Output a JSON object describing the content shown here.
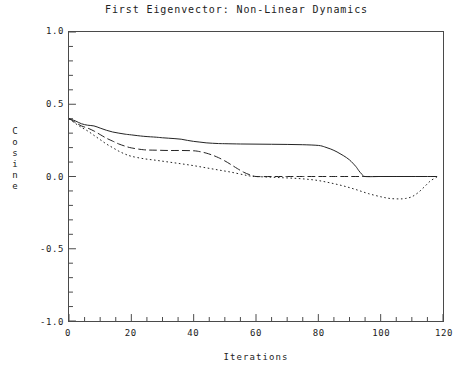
{
  "chart_data": {
    "type": "line",
    "title": "First Eigenvector: Non-Linear Dynamics",
    "xlabel": "Iterations",
    "ylabel": "Cosine",
    "xlim": [
      0,
      120
    ],
    "ylim": [
      -1.0,
      1.0
    ],
    "grid": false,
    "legend": "none",
    "x_ticks": [
      0,
      20,
      40,
      60,
      80,
      100,
      120
    ],
    "x_tick_labels": [
      "0",
      "20",
      "40",
      "60",
      "80",
      "100",
      "120"
    ],
    "x_minor_tick_step": 5,
    "y_ticks": [
      -1.0,
      -0.5,
      0.0,
      0.5,
      1.0
    ],
    "y_tick_labels": [
      "-1.0",
      "-0.5",
      "0.0",
      "0.5",
      "1.0"
    ],
    "y_minor_tick_step": 0.1,
    "series": [
      {
        "name": "solid-curve",
        "style": "solid",
        "color": "#222222",
        "x": [
          0,
          2,
          4,
          6,
          8,
          10,
          12,
          14,
          16,
          18,
          20,
          24,
          28,
          30,
          32,
          34,
          36,
          38,
          40,
          42,
          44,
          46,
          48,
          50,
          55,
          60,
          65,
          70,
          75,
          80,
          82,
          84,
          86,
          88,
          90,
          92,
          93,
          94,
          95,
          100,
          105,
          110,
          115,
          118
        ],
        "y": [
          0.4,
          0.385,
          0.365,
          0.355,
          0.35,
          0.335,
          0.32,
          0.308,
          0.3,
          0.293,
          0.288,
          0.278,
          0.272,
          0.268,
          0.265,
          0.262,
          0.258,
          0.25,
          0.243,
          0.238,
          0.233,
          0.23,
          0.228,
          0.227,
          0.225,
          0.224,
          0.223,
          0.222,
          0.22,
          0.215,
          0.205,
          0.19,
          0.17,
          0.145,
          0.115,
          0.07,
          0.04,
          0.015,
          0.0,
          0.0,
          0.0,
          0.0,
          0.0,
          0.0
        ]
      },
      {
        "name": "dashed-curve",
        "style": "dashed",
        "color": "#222222",
        "x": [
          0,
          2,
          4,
          6,
          8,
          10,
          12,
          14,
          16,
          18,
          20,
          24,
          28,
          32,
          36,
          40,
          42,
          44,
          46,
          48,
          50,
          52,
          54,
          56,
          58,
          60,
          65,
          70,
          75,
          80,
          85,
          90,
          95,
          100,
          105,
          110,
          115,
          118
        ],
        "y": [
          0.4,
          0.375,
          0.35,
          0.335,
          0.315,
          0.29,
          0.265,
          0.245,
          0.225,
          0.21,
          0.198,
          0.185,
          0.182,
          0.18,
          0.18,
          0.178,
          0.172,
          0.162,
          0.148,
          0.13,
          0.108,
          0.082,
          0.055,
          0.03,
          0.012,
          0.0,
          0.0,
          0.0,
          0.0,
          0.0,
          0.0,
          0.0,
          0.0,
          0.0,
          0.0,
          0.0,
          0.0,
          0.0
        ]
      },
      {
        "name": "dotted-curve",
        "style": "dotted",
        "color": "#222222",
        "x": [
          0,
          2,
          4,
          6,
          8,
          10,
          12,
          14,
          16,
          18,
          20,
          24,
          28,
          32,
          36,
          40,
          44,
          48,
          52,
          56,
          58,
          60,
          64,
          68,
          72,
          76,
          80,
          84,
          88,
          92,
          96,
          100,
          103,
          106,
          108,
          110,
          112,
          114,
          116,
          118
        ],
        "y": [
          0.4,
          0.368,
          0.34,
          0.315,
          0.285,
          0.255,
          0.225,
          0.2,
          0.175,
          0.155,
          0.14,
          0.123,
          0.112,
          0.1,
          0.088,
          0.075,
          0.06,
          0.045,
          0.03,
          0.012,
          0.004,
          0.0,
          -0.004,
          -0.008,
          -0.012,
          -0.018,
          -0.028,
          -0.045,
          -0.065,
          -0.09,
          -0.118,
          -0.14,
          -0.152,
          -0.155,
          -0.152,
          -0.14,
          -0.112,
          -0.072,
          -0.03,
          -0.005
        ]
      }
    ]
  },
  "axes": {
    "title": "First Eigenvector: Non-Linear Dynamics",
    "x_title": "Iterations",
    "y_title_letters": [
      "C",
      "o",
      "s",
      "i",
      "n",
      "e"
    ]
  }
}
